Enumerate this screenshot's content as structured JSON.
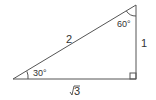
{
  "diagram": {
    "type": "right-triangle",
    "vertices": {
      "left": [
        13,
        79
      ],
      "right": [
        136,
        79
      ],
      "top": [
        136,
        5
      ]
    },
    "sides": {
      "hypotenuse": "2",
      "vertical": "1",
      "base": "√3"
    },
    "angles": {
      "left": "30°",
      "top": "60°",
      "right": "right-angle"
    },
    "stroke_color": "#555555",
    "text_color": "#333333"
  }
}
